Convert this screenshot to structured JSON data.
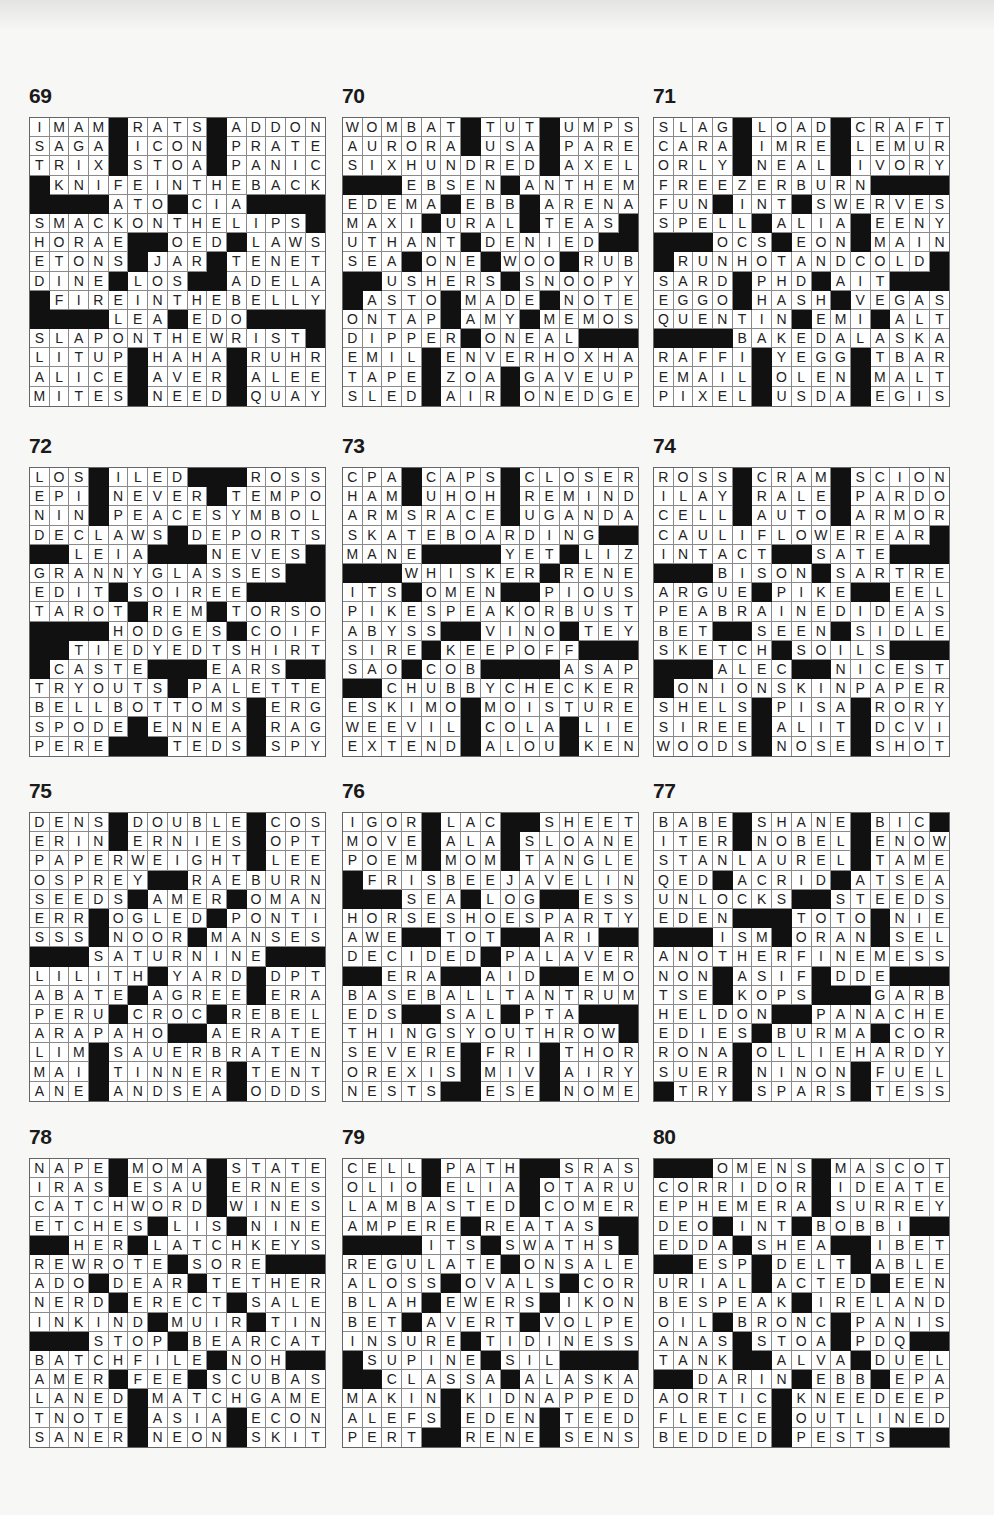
{
  "page": {
    "layout": {
      "columns": [
        29,
        342,
        653
      ],
      "rows": [
        84,
        434,
        779,
        1125
      ]
    },
    "puzzles": [
      {
        "number": "69",
        "rows": [
          "IMAM#RATS#ADDON",
          "SAGA#ICON#PRATE",
          "TRIX#STOA#PANIC",
          "#KNIFEINTHEBACK",
          "####ATO#CIA####",
          "SMACKONTHELIPS#",
          "HORAE##OED#LAWS",
          "ETONS#JAR#TENET",
          "DINE#LOS##ADELA",
          "#FIREINTHEBELLY",
          "####LEA#EDO####",
          "SLAPONTHEWRIST#",
          "LITUP#HAHA#RUHR",
          "ALICE#AVER#ALEE",
          "MITES#NEED#QUAY"
        ]
      },
      {
        "number": "70",
        "rows": [
          "WOMBAT#TUT#UMPS",
          "AURORA#USA#PARE",
          "SIXHUNDRED#AXEL",
          "###EBSEN#ANTHEM",
          "EDEMA#EBB#ARENA",
          "MAXI#URAL#TEAS#",
          "UTHANT#DENIED##",
          "SEA#ONE#WOO#RUB",
          "##USHERS#SNOOPY",
          "#ASTO#MADE#NOTE",
          "ONTAP#AMY#MEMOS",
          "DIPPER#ONEAL###",
          "EMIL#ENVERHOXHA",
          "TAPE#ZOA#GAVEUP",
          "SLED#AIR#ONEDGE"
        ]
      },
      {
        "number": "71",
        "rows": [
          "SLAG#LOAD#CRAFT",
          "CARA#IMRE#LEMUR",
          "ORLY#NEAL#IVORY",
          "FREEZERBURN####",
          "FUN#INT#SWERVES",
          "SPELL#ALIA#EENY",
          "###OCS#EON#MAIN",
          "#RUNHOTANDCOLD#",
          "SARD#PHD#AIT###",
          "EGGO#HASH#VEGAS",
          "QUENTIN#EMI#ALT",
          "####BAKEDALASKA",
          "RAFFI#YEGG#TBAR",
          "EMAIL#OLEN#MALT",
          "PIXEL#USDA#EGIS"
        ]
      },
      {
        "number": "72",
        "rows": [
          "LOS#ILED###ROSS",
          "EPI#NEVER#TEMPO",
          "NIN#PEACESYMBOL",
          "DECLAWS#DEPORTS",
          "##LEIA###NEVES#",
          "GRANNYGLASSES##",
          "EDIT#SOIREE####",
          "TAROT#REM#TORSO",
          "####HODGES#COIF",
          "##TIEDYEDTSHIRT",
          "#CASTE###EARS##",
          "TRYOUTS#PALETTE",
          "BELLBOTTOMS#ERG",
          "SPODE#ENNEA#RAG",
          "PERE###TEDS#SPY"
        ]
      },
      {
        "number": "73",
        "rows": [
          "CPA#CAPS#CLOSER",
          "HAM#UHOH#REMIND",
          "ARMSRACE#UGANDA",
          "SKATEBOARDING##",
          "MANE####YET#LIZ",
          "###WHISKER#RENE",
          "ITS#OMEN##PIOUS",
          "PIKESPEAKORBUST",
          "ABYSS##VINO#TEY",
          "SIRE#KEEPOFF###",
          "SAO#COB####ASAP",
          "##CHUBBYCHECKER",
          "ESKIMO#MOISTURE",
          "WEEVIL#COLA#LIE",
          "EXTEND#ALOU#KEN"
        ]
      },
      {
        "number": "74",
        "rows": [
          "ROSS#CRAM#SCION",
          "ILAY#RALE#PARDO",
          "CELL#AUTO#ARMOR",
          "CAULIFLOWEREAR#",
          "INTACT##SATE###",
          "###BISON#SARTRE",
          "ARGUE#PIKE##EEL",
          "PEABRAINEDIDEAS",
          "BET##SEEN#SIDLE",
          "SKETCH#SOILS###",
          "###ALEC##NICEST",
          "#ONIONSKINPAPER",
          "SHELS#PISA#RORY",
          "SIREE#ALIT#DCVI",
          "WOODS#NOSE#SHOT"
        ]
      },
      {
        "number": "75",
        "rows": [
          "DENS#DOUBLE#COS",
          "ERIN#ERNIES#OPT",
          "PAPERWEIGHT#LEE",
          "OSPREY##RAEBURN",
          "SEEDS#AMER#OMAN",
          "ERR#OGLED#PONTI",
          "SSS#NOOR#MANSES",
          "###SATURNINE###",
          "LILITH#YARD#DPT",
          "ABATE#AGREE#ERA",
          "PERU#CROC#REBEL",
          "ARAPAHO##AERATE",
          "LIM#SAUERBRATEN",
          "MAI#TINNER#TENT",
          "ANE#ANDSEA#ODDS"
        ]
      },
      {
        "number": "76",
        "rows": [
          "IGOR#LAC##SHEET",
          "MOVE#ALA#SLOANE",
          "POEM#MOM#TANGLE",
          "#FRISBEEJAVELIN",
          "###SEA#LOG##ESS",
          "HORSESHOESPARTY",
          "AWE##TOT##ARI##",
          "DECIDED#PALAVER",
          "##ERA##AID##EMO",
          "BASEBALLTANTRUM",
          "EDS##SAL#PTA###",
          "THINGSYOUTHROW#",
          "SEVERE#FRI#THOR",
          "OREXIS#MIV#AIRY",
          "NESTS##ESE#NOME"
        ]
      },
      {
        "number": "77",
        "rows": [
          "BABE#SHANE#BIC#",
          "ITER#NOBEL#ENOW",
          "STANLAUREL#TAME",
          "QED#ACRID#ATSEA",
          "UNLOCKS##STEEDS",
          "EDEN###TOTO#NIE",
          "###ISM#ORAN#SEL",
          "ANOTHERFINEMESS",
          "NON#ASIF#DDE###",
          "TSE#KOPS###GARB",
          "HELDON##PANACHE",
          "EDIES#BURMA#COR",
          "RONA#OLLIEHARDY",
          "SUER#NINON#FUEL",
          "#TRY#SPARS#TESS"
        ]
      },
      {
        "number": "78",
        "rows": [
          "NAPE#MOMA#STATE",
          "IRAS#ESAU#ERNES",
          "CATCHWORD#WINES",
          "ETCHES#LIS#NINE",
          "##HER#LATCHKEYS",
          "REWROTE#SORE###",
          "ADO#DEAR#TETHER",
          "NERD#ERECT#SALE",
          "INKIND#MUIR#TIN",
          "###STOP#BEARCAT",
          "BATCHFILE#NOH##",
          "AMER#FEE#SCUBAS",
          "LANED#MATCHGAME",
          "TNOTE#ASIA#ECON",
          "SANER#NEON#SKIT"
        ]
      },
      {
        "number": "79",
        "rows": [
          "CELL#PATH##SRAS",
          "OLIO#ELIA#OTARU",
          "LAMBASTED#COMER",
          "AMPERE#REATAS##",
          "####ITS#SWATHS#",
          "REGULATE#ONSALE",
          "ALOSS#OVALS#COR",
          "BLAH#EWERS#IKON",
          "BET#AVERT#VOLPE",
          "INSURE#TIDINESS",
          "#SUPINE#SIL####",
          "##CLASSA#ALASKA",
          "MAKIN#KIDNAPPED",
          "ALEFS#EDEN#TEED",
          "PERT##RENE#SENS"
        ]
      },
      {
        "number": "80",
        "rows": [
          "###OMENS#MASCOT",
          "CORRIDOR#IDEATE",
          "EPHEMERA#SURREY",
          "DEO#INT#BOBBI##",
          "EDDA#SHEA##IBET",
          "##ESP#DELT#ABLE",
          "URIAL#ACTED#EEN",
          "BESPEAK#IRELAND",
          "OIL#BRONC#PANIS",
          "ANAS#STOA#PDQ##",
          "TANK##ALVA#DUEL",
          "##DARIN#EBB#EPA",
          "AORTIC#KNEEDEEP",
          "FLEECE#OUTLINED",
          "BEDDED#PESTS###"
        ]
      }
    ]
  }
}
